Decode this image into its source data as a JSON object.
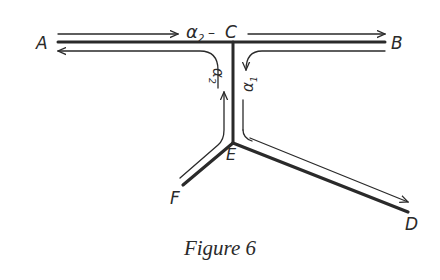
{
  "figure": {
    "caption": "Figure 6",
    "colors": {
      "ink": "#2a2a2a",
      "background": "#ffffff"
    },
    "nodes": {
      "A": "A",
      "B": "B",
      "C": "C",
      "D": "D",
      "E": "E",
      "F": "F"
    },
    "labels": {
      "alpha2_top": "α",
      "alpha2_top_sub": "2",
      "alpha_top_dash": "–",
      "alpha2_stem": "α",
      "alpha2_stem_sub": "2",
      "alpha1_stem": "α",
      "alpha1_stem_sub": "1"
    },
    "edges": [
      {
        "from": "A",
        "to": "B",
        "via": "C",
        "flow": "α2 (A → B)"
      },
      {
        "from": "B",
        "to": "E",
        "via": "C",
        "flow": "α1 (B → E)"
      },
      {
        "from": "E",
        "to": "A",
        "via": "C",
        "flow": "A ← C"
      },
      {
        "from": "F",
        "to": "C",
        "via": "E",
        "flow": "α2 (F → C)"
      },
      {
        "from": "E",
        "to": "D",
        "flow": "E → D"
      }
    ]
  }
}
